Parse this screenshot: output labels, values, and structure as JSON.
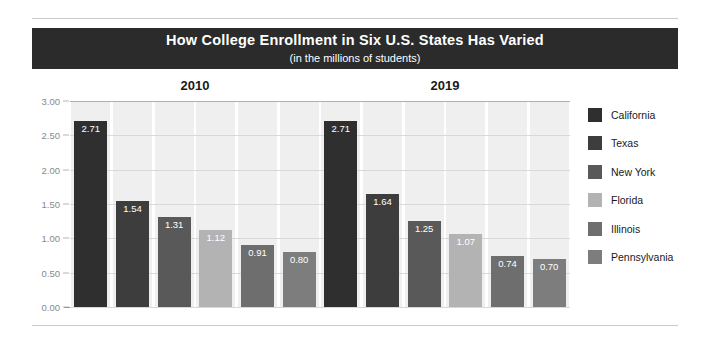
{
  "title": {
    "main": "How College Enrollment in Six U.S. States Has Varied",
    "subtitle": "(in the millions of students)"
  },
  "chart_data": {
    "type": "bar",
    "title": "How College Enrollment in Six U.S. States Has Varied",
    "subtitle": "(in the millions of students)",
    "xlabel": "",
    "ylabel": "",
    "ylim": [
      0,
      3.0
    ],
    "ytick_labels": [
      "3.00",
      "2.50",
      "2.00",
      "1.50",
      "1.00",
      "0.50",
      "0.00"
    ],
    "ytick_values": [
      3.0,
      2.5,
      2.0,
      1.5,
      1.0,
      0.5,
      0.0
    ],
    "grid": true,
    "legend_position": "right",
    "categories": [
      "2010",
      "2019"
    ],
    "series": [
      {
        "name": "California",
        "color": "#2f2f2f",
        "values": [
          2.71,
          2.71
        ],
        "labels": [
          "2.71",
          "2.71"
        ]
      },
      {
        "name": "Texas",
        "color": "#3d3d3d",
        "values": [
          1.54,
          1.64
        ],
        "labels": [
          "1.54",
          "1.64"
        ]
      },
      {
        "name": "New York",
        "color": "#595959",
        "values": [
          1.31,
          1.25
        ],
        "labels": [
          "1.31",
          "1.25"
        ]
      },
      {
        "name": "Florida",
        "color": "#b3b3b3",
        "values": [
          1.12,
          1.07
        ],
        "labels": [
          "1.12",
          "1.07"
        ]
      },
      {
        "name": "Illinois",
        "color": "#6e6e6e",
        "values": [
          0.91,
          0.74
        ],
        "labels": [
          "0.91",
          "0.74"
        ]
      },
      {
        "name": "Pennsylvania",
        "color": "#7d7d7d",
        "values": [
          0.8,
          0.7
        ],
        "labels": [
          "0.80",
          "0.70"
        ]
      }
    ],
    "group_labels": [
      "2010",
      "2019"
    ]
  },
  "legend": {
    "items": [
      {
        "label": "California",
        "color": "#2f2f2f"
      },
      {
        "label": "Texas",
        "color": "#3d3d3d"
      },
      {
        "label": "New York",
        "color": "#595959"
      },
      {
        "label": "Florida",
        "color": "#b3b3b3"
      },
      {
        "label": "Illinois",
        "color": "#6e6e6e"
      },
      {
        "label": "Pennsylvania",
        "color": "#7d7d7d"
      }
    ]
  },
  "colors": {
    "banner_bg": "#2b2b2b",
    "banner_text": "#ffffff",
    "band": "#efefef",
    "gridline": "#d8d8d8",
    "axis": "#9a9a9a",
    "tick_text": "#8a8a8a"
  }
}
